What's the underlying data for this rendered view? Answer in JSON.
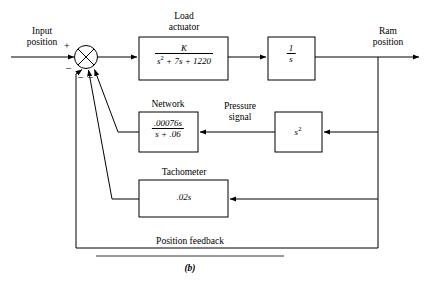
{
  "figure": {
    "caption": "(b)",
    "domain_type": "control-system-block-diagram"
  },
  "io_labels": {
    "input_line1": "Input",
    "input_line2": "position",
    "output_line1": "Ram",
    "output_line2": "position"
  },
  "summing_junction": {
    "symbol": "cross-circle",
    "plus_sign": "+",
    "minus_sign_1": "–",
    "minus_sign_2": "–",
    "minus_sign_3": "–",
    "input_count": 4
  },
  "blocks": [
    {
      "id": "load-actuator",
      "title_line1": "Load",
      "title_line2": "actuator",
      "numerator": "K",
      "denominator_pre": "s",
      "denominator_exp": "2",
      "denominator_post": " + 7s + 1220",
      "transfer_function": "K / (s^2 + 7s + 1220)"
    },
    {
      "id": "integrator",
      "title_line1": "",
      "title_line2": "",
      "numerator": "1",
      "denominator": "s",
      "transfer_function": "1/s"
    },
    {
      "id": "network",
      "title_line1": "Network",
      "title_line2": "",
      "numerator": ".00076s",
      "denominator": "s + .06",
      "transfer_function": ".00076s / (s + .06)"
    },
    {
      "id": "pressure-derivative",
      "title_line1": "",
      "title_line2": "",
      "body_pre": "s",
      "body_exp": "2",
      "transfer_function": "s^2"
    },
    {
      "id": "tachometer",
      "title_line1": "Tachometer",
      "title_line2": "",
      "body": ".02s",
      "transfer_function": ".02s"
    }
  ],
  "signal_labels": {
    "pressure_line1": "Pressure",
    "pressure_line2": "signal",
    "position_feedback": "Position feedback"
  },
  "colors": {
    "line": "#000000",
    "block_border": "#000000",
    "background": "#ffffff",
    "text": "#000000"
  }
}
